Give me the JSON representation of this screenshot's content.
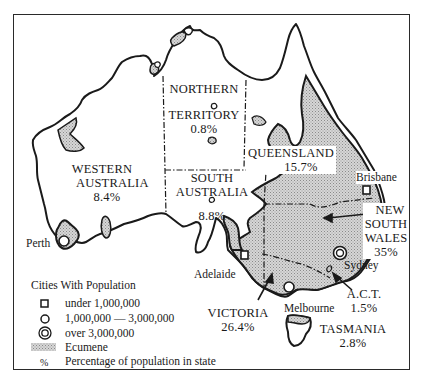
{
  "map": {
    "title": "Australia population distribution",
    "states": [
      {
        "id": "wa",
        "name_line1": "WESTERN",
        "name_line2": "AUSTRALIA",
        "percent": "8.4%"
      },
      {
        "id": "nt",
        "name_line1": "NORTHERN",
        "name_line2": "TERRITORY",
        "percent": "0.8%"
      },
      {
        "id": "sa",
        "name_line1": "SOUTH",
        "name_line2": "AUSTRALIA",
        "percent": "8.8%"
      },
      {
        "id": "qld",
        "name_line1": "QUEENSLAND",
        "percent": "15.7%"
      },
      {
        "id": "nsw",
        "name_line1": "NEW",
        "name_line2": "SOUTH",
        "name_line3": "WALES",
        "percent": "35%"
      },
      {
        "id": "act",
        "name_line1": "A.C.T.",
        "percent": "1.5%"
      },
      {
        "id": "vic",
        "name_line1": "VICTORIA",
        "percent": "26.4%"
      },
      {
        "id": "tas",
        "name_line1": "TASMANIA",
        "percent": "2.8%"
      }
    ],
    "cities": [
      {
        "name": "Perth",
        "symbol": "circle"
      },
      {
        "name": "Adelaide",
        "symbol": "circle"
      },
      {
        "name": "Melbourne",
        "symbol": "circle"
      },
      {
        "name": "Sydney",
        "symbol": "double-circle"
      },
      {
        "name": "Brisbane",
        "symbol": "square"
      }
    ],
    "colors": {
      "ink": "#1a1a1a",
      "ecumene": "#c8c8c8",
      "background": "#ffffff"
    }
  },
  "legend": {
    "title": "Cities With Population",
    "items": [
      {
        "symbol": "square",
        "label": "under 1,000,000"
      },
      {
        "symbol": "circle",
        "label": "1,000,000 — 3,000,000"
      },
      {
        "symbol": "double-circle",
        "label": "over 3,000,000"
      },
      {
        "symbol": "ecumene-swatch",
        "label": "Ecumene"
      },
      {
        "symbol": "percent",
        "glyph": "%",
        "label": "Percentage of population in state"
      }
    ]
  }
}
